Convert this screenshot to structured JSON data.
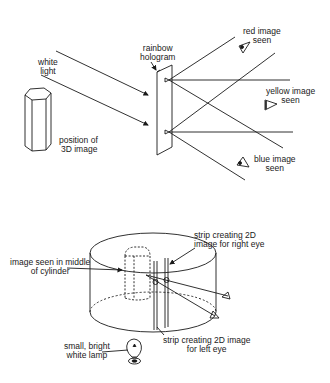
{
  "diagram": {
    "top": {
      "labels": {
        "white_light": [
          "white",
          "light"
        ],
        "hologram": [
          "rainbow",
          "hologram"
        ],
        "position": [
          "position of",
          "3D image"
        ],
        "red": [
          "red image",
          "seen"
        ],
        "yellow": [
          "yellow image",
          "seen"
        ],
        "blue": [
          "blue image",
          "seen"
        ]
      }
    },
    "bottom": {
      "labels": {
        "middle": [
          "image seen in middle",
          "of cylinder"
        ],
        "right_strip": [
          "strip creating 2D",
          "image for right eye"
        ],
        "left_strip": [
          "strip creating 2D image",
          "for left eye"
        ],
        "lamp": [
          "small, bright",
          "white lamp"
        ]
      }
    },
    "line_color": "#1a1a1a"
  }
}
